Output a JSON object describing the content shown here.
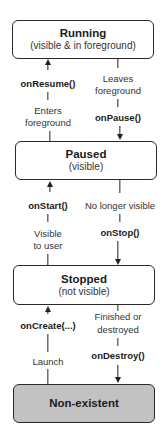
{
  "diagram": {
    "type": "state-lifecycle",
    "states": [
      {
        "id": "running",
        "title": "Running",
        "subtitle": "(visible & in foreground)"
      },
      {
        "id": "paused",
        "title": "Paused",
        "subtitle": "(visible)"
      },
      {
        "id": "stopped",
        "title": "Stopped",
        "subtitle": "(not visible)"
      },
      {
        "id": "nonexistent",
        "title": "Non-existent",
        "subtitle": ""
      }
    ],
    "transitions": [
      {
        "from": "paused",
        "to": "running",
        "method": "onResume()",
        "event_line1": "Enters",
        "event_line2": "foreground"
      },
      {
        "from": "running",
        "to": "paused",
        "method": "onPause()",
        "event_line1": "Leaves",
        "event_line2": "foreground"
      },
      {
        "from": "stopped",
        "to": "paused",
        "method": "onStart()",
        "event_line1": "Visible",
        "event_line2": "to user"
      },
      {
        "from": "paused",
        "to": "stopped",
        "method": "onStop()",
        "event_line1": "No longer visible",
        "event_line2": ""
      },
      {
        "from": "nonexistent",
        "to": "stopped",
        "method": "onCreate(...)",
        "event_line1": "Launch",
        "event_line2": ""
      },
      {
        "from": "stopped",
        "to": "nonexistent",
        "method": "onDestroy()",
        "event_line1": "Finished or",
        "event_line2": "destroyed"
      }
    ],
    "colors": {
      "box_fill": "#ffffff",
      "terminal_fill": "#c2c2c2",
      "stroke": "#2a2a2a"
    }
  }
}
